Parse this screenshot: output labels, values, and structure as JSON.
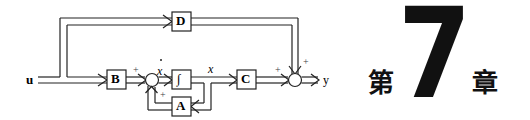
{
  "diagram": {
    "type": "state-space block diagram",
    "input_label": "u",
    "output_label": "y",
    "blocks": [
      {
        "id": "D",
        "label": "D"
      },
      {
        "id": "B",
        "label": "B"
      },
      {
        "id": "integrator",
        "label": "∫"
      },
      {
        "id": "C",
        "label": "C"
      },
      {
        "id": "A",
        "label": "A"
      }
    ],
    "signals": {
      "state": "x",
      "state_derivative": "x"
    },
    "sum_signs": {
      "sum1_from_B": "+",
      "sum1_from_A": "+",
      "sum2_from_C": "+",
      "sum2_from_D": "+"
    }
  },
  "chapter": {
    "prefix": "第",
    "number": "7",
    "suffix": "章"
  },
  "colors": {
    "ink": "#222222",
    "background": "#ffffff"
  }
}
